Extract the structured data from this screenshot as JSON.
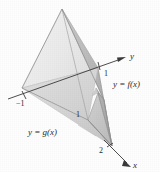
{
  "figure": {
    "kind": "3d-solid-diagram",
    "background_color": "#fefefe",
    "axes": {
      "y_axis_label": "y",
      "x_axis_label": "x"
    },
    "tick_labels": {
      "y_negative_one": "−1",
      "y_one": "1",
      "interior_one": "1",
      "x_two": "2"
    },
    "curve_labels": {
      "f": "y = f(x)",
      "g": "y = g(x)"
    },
    "colors": {
      "face_light": "#efefef",
      "face_mid_light": "#dcdcdc",
      "face_mid": "#cccccc",
      "face_dark": "#b4b4b4",
      "face_darker": "#a6a6a6",
      "edge": "#8c8c8c",
      "axis_line": "#3a3a3a",
      "text": "#2b2b2b"
    }
  }
}
